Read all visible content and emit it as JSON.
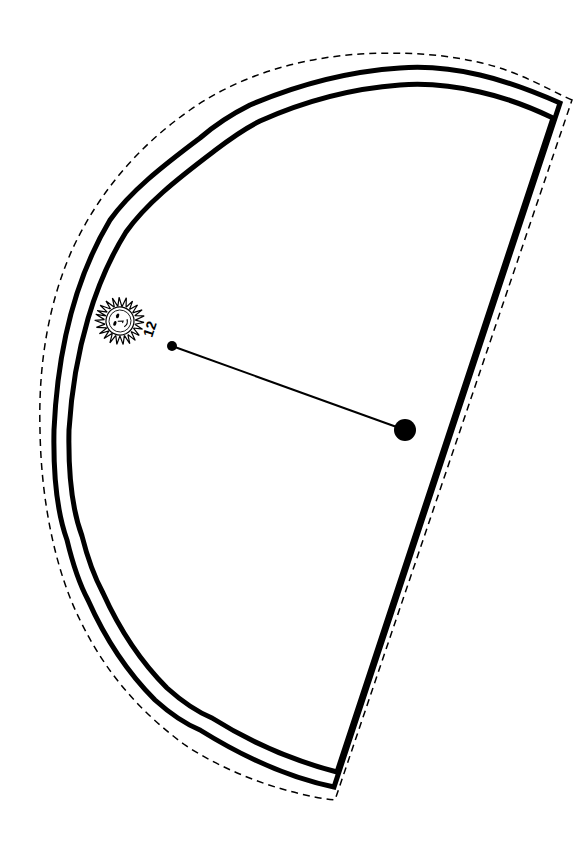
{
  "template": {
    "title": "Sundial sector cutout",
    "hour_label": "12",
    "icons": [
      "sun-face-icon"
    ]
  },
  "colors": {
    "line": "#000000",
    "background": "#ffffff"
  },
  "shape": {
    "outer_border": "solid thick",
    "inner_border": "solid thick",
    "cut_line": "dashed"
  },
  "gnomon": {
    "pivot": "large-dot",
    "tip": "small-dot",
    "tip_label": "12"
  }
}
